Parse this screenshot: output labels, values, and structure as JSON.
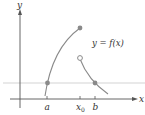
{
  "diagram": {
    "colors": {
      "axis": "#555555",
      "curve": "#8a8a8a",
      "reference_line": "#c8c8c8",
      "point_fill": "#8a8a8a",
      "open_point_fill": "#ffffff",
      "text": "#333333"
    },
    "labels": {
      "y_axis": "y",
      "x_axis": "x",
      "function": "y = f(x)",
      "tick_a": "a",
      "tick_x0": "x",
      "tick_x0_sub": "0",
      "tick_b": "b"
    },
    "points": [
      {
        "name": "left-curve-at-a",
        "type": "filled"
      },
      {
        "name": "left-curve-end-at-x0",
        "type": "filled"
      },
      {
        "name": "right-curve-start-at-x0",
        "type": "open"
      },
      {
        "name": "right-curve-at-b",
        "type": "filled"
      }
    ]
  }
}
